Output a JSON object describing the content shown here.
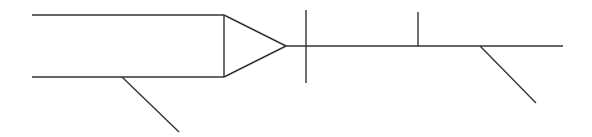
{
  "diagram": {
    "stroke_color": "#333333",
    "background": "#ffffff",
    "stroke_width": 1.4,
    "lines": [
      {
        "name": "upper-parallel-line",
        "x1": 32,
        "y1": 15,
        "x2": 224,
        "y2": 15
      },
      {
        "name": "lower-parallel-line",
        "x1": 32,
        "y1": 77,
        "x2": 224,
        "y2": 77
      },
      {
        "name": "triangle-base",
        "x1": 224,
        "y1": 15,
        "x2": 224,
        "y2": 77
      },
      {
        "name": "triangle-upper-edge",
        "x1": 224,
        "y1": 15,
        "x2": 286,
        "y2": 46
      },
      {
        "name": "triangle-lower-edge",
        "x1": 224,
        "y1": 77,
        "x2": 286,
        "y2": 46
      },
      {
        "name": "lower-left-diagonal-branch",
        "x1": 122,
        "y1": 77,
        "x2": 179,
        "y2": 132
      },
      {
        "name": "main-horizontal-line",
        "x1": 286,
        "y1": 46,
        "x2": 563,
        "y2": 46
      },
      {
        "name": "cross-vertical-tick",
        "x1": 306,
        "y1": 10,
        "x2": 306,
        "y2": 83
      },
      {
        "name": "upper-vertical-stub",
        "x1": 418,
        "y1": 12,
        "x2": 418,
        "y2": 46
      },
      {
        "name": "right-diagonal-branch",
        "x1": 480,
        "y1": 46,
        "x2": 536,
        "y2": 103
      }
    ]
  }
}
